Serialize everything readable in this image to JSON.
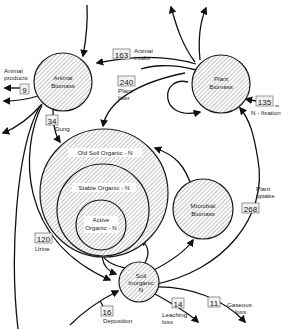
{
  "diagram": {
    "type": "nitrogen-cycle-flow",
    "pools": {
      "animal_biomass": {
        "line1": "Animal",
        "line2": "Biomass"
      },
      "plant_biomass": {
        "line1": "Plant",
        "line2": "Biomass"
      },
      "old_soil_organic": {
        "label": "Old Soil Organic - N"
      },
      "stable_organic": {
        "label": "Stable Organic - N"
      },
      "active_organic": {
        "line1": "Active",
        "line2": "Organic - N"
      },
      "microbial_biomass": {
        "line1": "Microbial",
        "line2": "Biomass"
      },
      "soil_inorganic": {
        "line1": "Soil",
        "line2": "Inorganic",
        "line3": "N"
      }
    },
    "flows": {
      "animal_intake": {
        "value": "163",
        "line1": "Animal",
        "line2": "intake"
      },
      "plant_litter": {
        "value": "240",
        "line1": "Plant",
        "line2": "litter"
      },
      "animal_products": {
        "value": "9",
        "line1": "Animal",
        "line2": "products"
      },
      "dung": {
        "value": "34",
        "label": "Dung"
      },
      "n_fixation": {
        "value": "135",
        "label": "N - fixation"
      },
      "plant_uptake": {
        "value": "268",
        "line1": "Plant",
        "line2": "uptake"
      },
      "urine": {
        "value": "120",
        "label": "Urine"
      },
      "deposition": {
        "value": "16",
        "label": "Deposition"
      },
      "leaching_loss": {
        "value": "14",
        "line1": "Leaching",
        "line2": "loss"
      },
      "gaseous_loss": {
        "value": "11",
        "line1": "Gaseous",
        "line2": "loss"
      }
    },
    "colors": {
      "stroke": "#1a1a1a",
      "hatch": "#6a6a6a",
      "background": "#ffffff"
    }
  }
}
